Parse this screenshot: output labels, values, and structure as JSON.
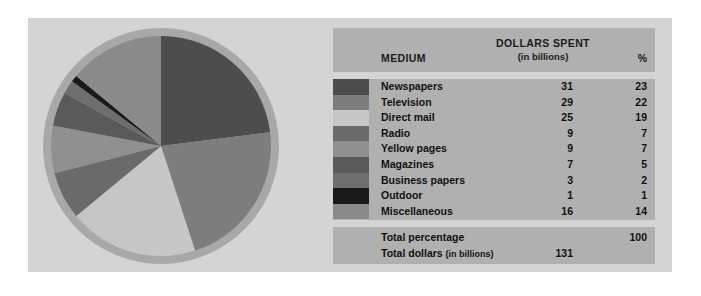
{
  "chart_data": {
    "type": "pie",
    "title": "",
    "legend_position": "right-table",
    "categories": [
      "Newspapers",
      "Television",
      "Direct mail",
      "Radio",
      "Yellow pages",
      "Magazines",
      "Business papers",
      "Outdoor",
      "Miscellaneous"
    ],
    "values": [
      23,
      22,
      19,
      7,
      7,
      5,
      2,
      1,
      14
    ],
    "dollars": [
      31,
      29,
      25,
      9,
      9,
      7,
      3,
      1,
      16
    ],
    "unit": "percent",
    "dollars_unit": "billions of dollars",
    "colors": [
      "#4d4d4d",
      "#7d7d7d",
      "#c6c6c6",
      "#6a6a6a",
      "#909090",
      "#5a5a5a",
      "#6e6e6e",
      "#1a1a1a",
      "#8a8a8a"
    ],
    "start_angle": 0,
    "direction": "clockwise",
    "total_percentage": 100,
    "total_dollars": 131
  },
  "panel": {
    "background": "#d4d4d4",
    "ring_color": "#a8a8a8"
  },
  "table": {
    "header": {
      "medium": "MEDIUM",
      "dollars_spent": "DOLLARS SPENT",
      "dollars_spent_sub": "(in billions)",
      "percent": "%"
    },
    "rows": [
      {
        "swatch": "#4d4d4d",
        "label": "Newspapers",
        "dollars": "31",
        "percent": "23"
      },
      {
        "swatch": "#7d7d7d",
        "label": "Television",
        "dollars": "29",
        "percent": "22"
      },
      {
        "swatch": "#c6c6c6",
        "label": "Direct mail",
        "dollars": "25",
        "percent": "19"
      },
      {
        "swatch": "#6a6a6a",
        "label": "Radio",
        "dollars": "9",
        "percent": "7"
      },
      {
        "swatch": "#909090",
        "label": "Yellow pages",
        "dollars": "9",
        "percent": "7"
      },
      {
        "swatch": "#5a5a5a",
        "label": "Magazines",
        "dollars": "7",
        "percent": "5"
      },
      {
        "swatch": "#6e6e6e",
        "label": "Business papers",
        "dollars": "3",
        "percent": "2"
      },
      {
        "swatch": "#1a1a1a",
        "label": "Outdoor",
        "dollars": "1",
        "percent": "1"
      },
      {
        "swatch": "#8a8a8a",
        "label": "Miscellaneous",
        "dollars": "16",
        "percent": "14"
      }
    ],
    "totals": {
      "percentage_label": "Total percentage",
      "percentage_value": "100",
      "dollars_label": "Total dollars",
      "dollars_label_sub": "(in billions)",
      "dollars_value": "131"
    }
  }
}
